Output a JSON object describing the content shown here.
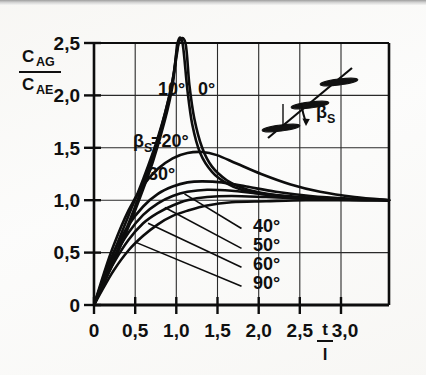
{
  "figure": {
    "name": "cascade-correction-chart",
    "background_color": "#fbfbfa",
    "ink_color": "#101010"
  },
  "chart_data": {
    "type": "line",
    "title": "",
    "xlabel_numerator": "t",
    "xlabel_denominator": "l",
    "ylabel_numerator": "C",
    "ylabel_numerator_sub": "AG",
    "ylabel_denominator": "C",
    "ylabel_denominator_sub": "AE",
    "xlim": [
      0,
      3.0
    ],
    "ylim": [
      0,
      2.5
    ],
    "xticks": [
      0,
      0.5,
      1.0,
      1.5,
      2.0,
      2.5,
      3.0
    ],
    "xticklabels": [
      "0",
      "0,5",
      "1,0",
      "1,5",
      "2,0",
      "2,5",
      "3,0"
    ],
    "yticks": [
      0,
      0.5,
      1.0,
      1.5,
      2.0,
      2.5
    ],
    "yticklabels": [
      "0",
      "0,5",
      "1,0",
      "1,5",
      "2,0",
      "2,5"
    ],
    "grid": true,
    "legend_position": "inline-annotations",
    "series": [
      {
        "name": "0 deg",
        "label": "0°",
        "label_x": 1.28,
        "label_y": 2.12,
        "points": [
          [
            0,
            0
          ],
          [
            0.15,
            0.33
          ],
          [
            0.3,
            0.66
          ],
          [
            0.45,
            1.02
          ],
          [
            0.6,
            1.42
          ],
          [
            0.72,
            1.82
          ],
          [
            0.8,
            2.15
          ],
          [
            0.86,
            2.5
          ],
          [
            0.93,
            2.5
          ],
          [
            0.97,
            2.1
          ],
          [
            1.02,
            1.78
          ],
          [
            1.1,
            1.5
          ],
          [
            1.2,
            1.32
          ],
          [
            1.35,
            1.19
          ],
          [
            1.5,
            1.12
          ],
          [
            1.7,
            1.07
          ],
          [
            2.0,
            1.03
          ],
          [
            2.4,
            1.01
          ],
          [
            3.0,
            1.0
          ]
        ]
      },
      {
        "name": "10 deg",
        "label": "10°",
        "label_x": 0.92,
        "label_y": 2.12,
        "points": [
          [
            0,
            0
          ],
          [
            0.15,
            0.31
          ],
          [
            0.3,
            0.63
          ],
          [
            0.45,
            0.98
          ],
          [
            0.6,
            1.37
          ],
          [
            0.72,
            1.76
          ],
          [
            0.8,
            2.1
          ],
          [
            0.85,
            2.5
          ],
          [
            0.9,
            2.5
          ],
          [
            0.95,
            2.05
          ],
          [
            1.0,
            1.72
          ],
          [
            1.08,
            1.45
          ],
          [
            1.2,
            1.27
          ],
          [
            1.35,
            1.16
          ],
          [
            1.5,
            1.1
          ],
          [
            1.7,
            1.06
          ],
          [
            2.0,
            1.025
          ],
          [
            2.4,
            1.008
          ],
          [
            3.0,
            1.0
          ]
        ]
      },
      {
        "name": "20 deg",
        "label": "βS=20°",
        "label_x": 0.55,
        "label_y": 1.53,
        "points": [
          [
            0,
            0
          ],
          [
            0.1,
            0.26
          ],
          [
            0.2,
            0.5
          ],
          [
            0.35,
            0.85
          ],
          [
            0.5,
            1.2
          ],
          [
            0.65,
            1.6
          ],
          [
            0.78,
            2.05
          ],
          [
            0.86,
            2.5
          ]
        ]
      },
      {
        "name": "30 deg",
        "label": "30°",
        "label_x": 0.74,
        "label_y": 1.28,
        "points": [
          [
            0,
            0
          ],
          [
            0.1,
            0.3
          ],
          [
            0.2,
            0.57
          ],
          [
            0.35,
            0.9
          ],
          [
            0.5,
            1.14
          ],
          [
            0.65,
            1.3
          ],
          [
            0.8,
            1.4
          ],
          [
            0.95,
            1.45
          ],
          [
            1.1,
            1.46
          ],
          [
            1.25,
            1.43
          ],
          [
            1.45,
            1.35
          ],
          [
            1.7,
            1.25
          ],
          [
            2.0,
            1.15
          ],
          [
            2.3,
            1.08
          ],
          [
            2.65,
            1.03
          ],
          [
            3.0,
            1.0
          ]
        ]
      },
      {
        "name": "40 deg",
        "label": "40°",
        "label_x": 1.56,
        "label_y": 0.73,
        "leader_from": [
          1.5,
          0.73
        ],
        "leader_to": [
          0.92,
          1.06
        ],
        "points": [
          [
            0,
            0
          ],
          [
            0.1,
            0.27
          ],
          [
            0.2,
            0.5
          ],
          [
            0.35,
            0.76
          ],
          [
            0.5,
            0.94
          ],
          [
            0.65,
            1.06
          ],
          [
            0.8,
            1.13
          ],
          [
            0.95,
            1.17
          ],
          [
            1.1,
            1.18
          ],
          [
            1.3,
            1.17
          ],
          [
            1.55,
            1.13
          ],
          [
            1.85,
            1.08
          ],
          [
            2.2,
            1.04
          ],
          [
            2.6,
            1.015
          ],
          [
            3.0,
            1.0
          ]
        ]
      },
      {
        "name": "50 deg",
        "label": "50°",
        "label_x": 1.56,
        "label_y": 0.54,
        "leader_from": [
          1.5,
          0.54
        ],
        "leader_to": [
          0.72,
          0.93
        ],
        "points": [
          [
            0,
            0
          ],
          [
            0.1,
            0.24
          ],
          [
            0.2,
            0.45
          ],
          [
            0.35,
            0.69
          ],
          [
            0.5,
            0.86
          ],
          [
            0.65,
            0.97
          ],
          [
            0.8,
            1.04
          ],
          [
            0.95,
            1.08
          ],
          [
            1.15,
            1.1
          ],
          [
            1.4,
            1.09
          ],
          [
            1.7,
            1.06
          ],
          [
            2.1,
            1.03
          ],
          [
            2.5,
            1.01
          ],
          [
            3.0,
            1.0
          ]
        ]
      },
      {
        "name": "60 deg",
        "label": "60°",
        "label_x": 1.56,
        "label_y": 0.36,
        "leader_from": [
          1.5,
          0.36
        ],
        "leader_to": [
          0.55,
          0.78
        ],
        "points": [
          [
            0,
            0
          ],
          [
            0.1,
            0.21
          ],
          [
            0.2,
            0.4
          ],
          [
            0.35,
            0.62
          ],
          [
            0.5,
            0.78
          ],
          [
            0.65,
            0.88
          ],
          [
            0.8,
            0.95
          ],
          [
            0.95,
            1.0
          ],
          [
            1.15,
            1.03
          ],
          [
            1.4,
            1.04
          ],
          [
            1.75,
            1.03
          ],
          [
            2.15,
            1.015
          ],
          [
            2.6,
            1.005
          ],
          [
            3.0,
            1.0
          ]
        ]
      },
      {
        "name": "90 deg",
        "label": "90°",
        "label_x": 1.56,
        "label_y": 0.18,
        "leader_from": [
          1.5,
          0.18
        ],
        "leader_to": [
          0.42,
          0.6
        ],
        "points": [
          [
            0,
            0
          ],
          [
            0.1,
            0.17
          ],
          [
            0.2,
            0.33
          ],
          [
            0.35,
            0.52
          ],
          [
            0.5,
            0.66
          ],
          [
            0.65,
            0.77
          ],
          [
            0.8,
            0.85
          ],
          [
            0.95,
            0.9
          ],
          [
            1.15,
            0.95
          ],
          [
            1.4,
            0.98
          ],
          [
            1.75,
            0.99
          ],
          [
            2.15,
            1.0
          ],
          [
            2.6,
            1.0
          ],
          [
            3.0,
            1.0
          ]
        ]
      }
    ]
  },
  "inset": {
    "name": "blade-cascade-sketch",
    "angle_label": "βS",
    "angle_label_beta": "β",
    "angle_label_sub": "S",
    "blade_count": 3
  }
}
